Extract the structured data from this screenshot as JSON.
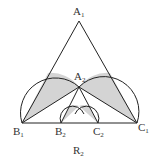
{
  "title": "R2",
  "points": {
    "A1": {
      "label": "A",
      "sub": "1",
      "x": 79,
      "y": 21
    },
    "A2": {
      "label": "A",
      "sub": "2",
      "x": 79,
      "y": 87
    },
    "B1": {
      "label": "B",
      "sub": "1",
      "x": 22,
      "y": 123
    },
    "C1": {
      "label": "C",
      "sub": "1",
      "x": 137,
      "y": 123
    },
    "B2": {
      "label": "B",
      "sub": "2",
      "x": 61,
      "y": 123
    },
    "C2": {
      "label": "C",
      "sub": "2",
      "x": 98,
      "y": 123
    }
  },
  "caption": {
    "label": "R",
    "sub": "2"
  },
  "colors": {
    "stroke": "#222222",
    "fill": "#d4d4d4"
  }
}
